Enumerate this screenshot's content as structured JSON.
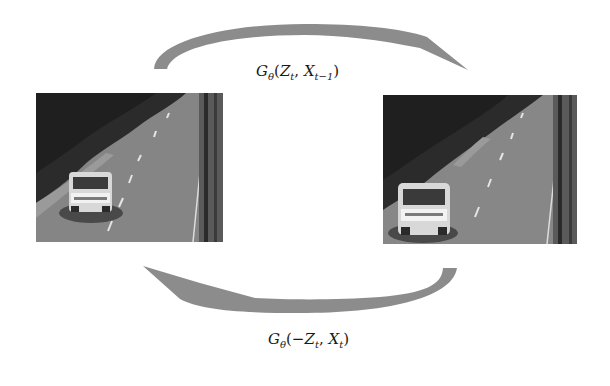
{
  "diagram": {
    "colors": {
      "arrow": "#8c8c8c",
      "background": "#ffffff",
      "text": "#1a1a1a"
    },
    "frames": [
      {
        "id": "frame-prev",
        "label": "X_{t-1}",
        "position": "left"
      },
      {
        "id": "frame-curr",
        "label": "X_t",
        "position": "right"
      }
    ],
    "forward": {
      "direction": "left-to-right",
      "label_parts": {
        "G": "G",
        "theta": "θ",
        "open": "(",
        "Z": "Z",
        "t1": "t",
        "comma": ", ",
        "X": "X",
        "t2": "t−1",
        "close": ")"
      }
    },
    "backward": {
      "direction": "right-to-left",
      "label_parts": {
        "G": "G",
        "theta": "θ",
        "open": "(−",
        "Z": "Z",
        "t1": "t",
        "comma": ", ",
        "X": "X",
        "t2": "t",
        "close": ")"
      }
    }
  }
}
